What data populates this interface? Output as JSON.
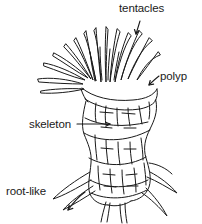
{
  "figure": {
    "background_color": "#ffffff",
    "ink_color": "#1a1a1a",
    "width": 202,
    "height": 224
  },
  "labels": {
    "tentacles": "tentacles",
    "polyp": "polyp",
    "skeleton": "skeleton",
    "root_like": {
      "line1": "root-like",
      "line2": "support",
      "line3": "structure"
    }
  },
  "parts": {
    "tentacle_cluster": "tentacle-cluster",
    "polyp_rim": "polyp-rim",
    "skeleton_column": "skeleton-column",
    "root_structure": "root-like-support-structure"
  },
  "leaders": {
    "tentacles_arrow": "arrow pointing down into tentacle cluster",
    "polyp_arrow": "arrow pointing left to polyp rim",
    "skeleton_arrow": "arrow pointing right into skeleton column",
    "root_arrow": "curved arrow pointing down-left to root structure"
  }
}
